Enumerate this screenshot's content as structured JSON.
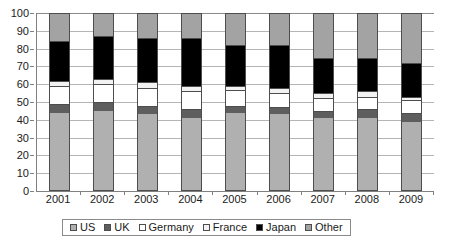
{
  "chart_data": {
    "type": "bar",
    "stacked": true,
    "title": "",
    "subtitle": "",
    "xlabel": "",
    "ylabel": "",
    "ylim": [
      0,
      100
    ],
    "ytick_labels": [
      "0",
      "10",
      "20",
      "30",
      "40",
      "50",
      "60",
      "70",
      "80",
      "90",
      "100"
    ],
    "ytick_values": [
      0,
      10,
      20,
      30,
      40,
      50,
      60,
      70,
      80,
      90,
      100
    ],
    "grid": true,
    "grid_axis": "y",
    "legend_position": "bottom",
    "categories": [
      "2001",
      "2002",
      "2003",
      "2004",
      "2005",
      "2006",
      "2007",
      "2008",
      "2009"
    ],
    "series": [
      {
        "name": "US",
        "color": "#b0b0b0",
        "values": [
          44,
          45,
          43,
          41,
          44,
          43,
          41,
          41,
          39
        ]
      },
      {
        "name": "UK",
        "color": "#5e5e5e",
        "values": [
          5,
          5,
          5,
          5,
          4,
          4,
          4,
          5,
          5
        ]
      },
      {
        "name": "Germany",
        "color": "#ffffff",
        "values": [
          10,
          10,
          10,
          10,
          9,
          8,
          7,
          7,
          7
        ]
      },
      {
        "name": "France",
        "color": "#f2f2f2",
        "values": [
          3,
          3,
          3,
          3,
          2,
          3,
          3,
          3,
          2
        ]
      },
      {
        "name": "Japan",
        "color": "#000000",
        "values": [
          22,
          24,
          25,
          27,
          23,
          24,
          20,
          19,
          19
        ]
      },
      {
        "name": "Other",
        "color": "#a3a3a3",
        "values": [
          16,
          13,
          14,
          14,
          18,
          18,
          25,
          25,
          28
        ]
      }
    ]
  },
  "axis": {
    "y_color": "#808080",
    "grid_color": "#b5b5b5"
  }
}
